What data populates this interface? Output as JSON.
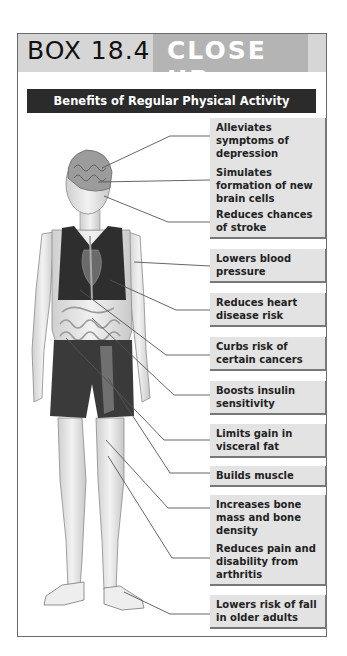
{
  "header": {
    "box_label": "BOX 18.4",
    "section_label": "CLOSE UP"
  },
  "banner": {
    "title": "Benefits of Regular Physical Activity"
  },
  "callouts": [
    {
      "text": "Alleviates symptoms of depression",
      "target": "brain"
    },
    {
      "text": "Simulates formation of new brain cells",
      "target": "brain"
    },
    {
      "text": "Reduces chances of stroke",
      "target": "brain"
    },
    {
      "text": "Lowers blood pressure",
      "target": "blood vessels"
    },
    {
      "text": "Reduces heart disease risk",
      "target": "heart"
    },
    {
      "text": "Curbs risk of certain cancers",
      "target": "chest/colon"
    },
    {
      "text": "Boosts insulin sensitivity",
      "target": "abdomen"
    },
    {
      "text": "Limits gain in visceral fat",
      "target": "abdominal fat"
    },
    {
      "text": "Builds muscle",
      "target": "thigh muscle"
    },
    {
      "text": "Increases bone mass and bone density",
      "target": "femur"
    },
    {
      "text": "Reduces pain and disability from arthritis",
      "target": "knee"
    },
    {
      "text": "Lowers risk of fall in older adults",
      "target": "foot"
    }
  ],
  "colors": {
    "header_band": "#d6d6d6",
    "header_accent": "#b4b4b4",
    "banner_bg": "#2b2b2b",
    "callout_bg": "#e3e3e3",
    "frame_border": "#6a6a6a"
  }
}
